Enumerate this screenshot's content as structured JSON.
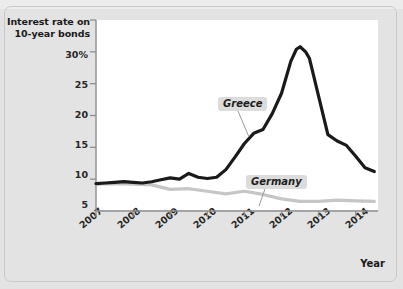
{
  "figure": {
    "title": "Interest rate on 10-year bonds",
    "title_line1": "Interest rate on",
    "title_line2": "10-year bonds",
    "xaxis_caption": "Year"
  },
  "colors": {
    "greece_line": "#1a1a1a",
    "germany_line": "#c6c6c6",
    "plot_background": "#ffffff",
    "figure_background": "#e3e3e3",
    "frame_border": "#c9c9c9",
    "axis": "#8f8f8f",
    "label_badge": "#dcdcdc",
    "text": "#262626"
  },
  "chart_data": {
    "type": "line",
    "title": "Interest rate on 10-year bonds",
    "xlabel": "Year",
    "ylabel": "Interest rate on 10-year bonds",
    "ylim": [
      0,
      30
    ],
    "xlim": [
      2007,
      2014.6
    ],
    "grid": false,
    "legend_position": "inline-annotations",
    "ytick_labels": [
      "30%",
      "25",
      "20",
      "15",
      "10",
      "5"
    ],
    "ytick_values": [
      30,
      25,
      20,
      15,
      10,
      5
    ],
    "xtick_labels": [
      "2007",
      "2008",
      "2009",
      "2010",
      "2011",
      "2012",
      "2013",
      "2014"
    ],
    "xtick_values": [
      2007,
      2008,
      2009,
      2010,
      2011,
      2012,
      2013,
      2014
    ],
    "series": [
      {
        "name": "Greece",
        "color": "#1a1a1a",
        "x": [
          2007.0,
          2007.25,
          2007.5,
          2007.75,
          2008.0,
          2008.25,
          2008.5,
          2008.75,
          2009.0,
          2009.25,
          2009.5,
          2009.75,
          2010.0,
          2010.25,
          2010.5,
          2010.75,
          2011.0,
          2011.25,
          2011.5,
          2011.75,
          2012.0,
          2012.1,
          2012.25,
          2012.4,
          2012.5,
          2012.65,
          2012.75,
          2013.0,
          2013.25,
          2013.5,
          2013.75,
          2014.0,
          2014.25,
          2014.5
        ],
        "values": [
          4.3,
          4.4,
          4.5,
          4.6,
          4.5,
          4.4,
          4.6,
          4.9,
          5.2,
          5.0,
          5.9,
          5.3,
          5.1,
          5.3,
          6.5,
          8.5,
          10.6,
          12.2,
          12.8,
          15.3,
          18.5,
          20.5,
          23.5,
          25.4,
          25.8,
          25.0,
          24.0,
          18.0,
          12.0,
          11.0,
          10.3,
          8.6,
          6.8,
          6.2
        ]
      },
      {
        "name": "Germany",
        "color": "#c6c6c6",
        "x": [
          2007.0,
          2007.5,
          2008.0,
          2008.5,
          2009.0,
          2009.5,
          2010.0,
          2010.5,
          2011.0,
          2011.5,
          2012.0,
          2012.5,
          2013.0,
          2013.5,
          2014.0,
          2014.5
        ],
        "values": [
          4.2,
          4.3,
          4.2,
          4.1,
          3.4,
          3.5,
          3.1,
          2.7,
          3.1,
          2.6,
          1.9,
          1.5,
          1.5,
          1.7,
          1.6,
          1.5
        ]
      }
    ],
    "annotations": [
      {
        "text": "Greece",
        "series": "Greece"
      },
      {
        "text": "Germany",
        "series": "Germany"
      }
    ]
  }
}
